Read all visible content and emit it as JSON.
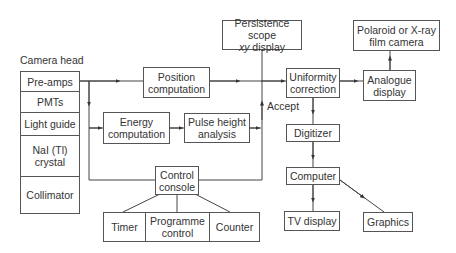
{
  "diagram": {
    "camera_head": {
      "title": "Camera head",
      "components": [
        "Pre-amps",
        "PMTs",
        "Light guide",
        "NaI (Tl)\ncrystal",
        "Collimator"
      ]
    },
    "nodes": {
      "position_computation": "Position\ncomputation",
      "energy_computation": "Energy\ncomputation",
      "pulse_height_analysis": "Pulse height\nanalysis",
      "persistence_scope_line1": "Persistence scope",
      "persistence_scope_italic": "xy",
      "persistence_scope_line2": " display",
      "uniformity_correction": "Uniformity\ncorrection",
      "analogue_display": "Analogue\ndisplay",
      "polaroid_camera": "Polaroid or X-ray\nfilm camera",
      "digitizer": "Digitizer",
      "computer": "Computer",
      "tv_display": "TV display",
      "graphics": "Graphics",
      "control_console": "Control\nconsole"
    },
    "control_units": [
      "Timer",
      "Programme\ncontrol",
      "Counter"
    ],
    "edge_labels": {
      "accept": "Accept"
    },
    "edges": [
      [
        "Pre-amps",
        "Position computation"
      ],
      [
        "Pre-amps",
        "Energy computation"
      ],
      [
        "Energy computation",
        "Pulse height analysis"
      ],
      [
        "Pulse height analysis",
        "Accept line"
      ],
      [
        "Accept line",
        "Uniformity correction"
      ],
      [
        "Position computation",
        "Uniformity correction"
      ],
      [
        "Persistence scope xy display",
        "Uniformity line"
      ],
      [
        "Uniformity correction",
        "Analogue display"
      ],
      [
        "Analogue display",
        "Polaroid or X-ray film camera"
      ],
      [
        "Uniformity correction",
        "Digitizer"
      ],
      [
        "Digitizer",
        "Computer"
      ],
      [
        "Computer",
        "TV display"
      ],
      [
        "Computer",
        "Graphics"
      ],
      [
        "Control console",
        "Timer"
      ],
      [
        "Control console",
        "Programme control"
      ],
      [
        "Control console",
        "Counter"
      ],
      [
        "Control console",
        "Pre-amps line"
      ],
      [
        "Control console",
        "Accept line"
      ]
    ]
  }
}
